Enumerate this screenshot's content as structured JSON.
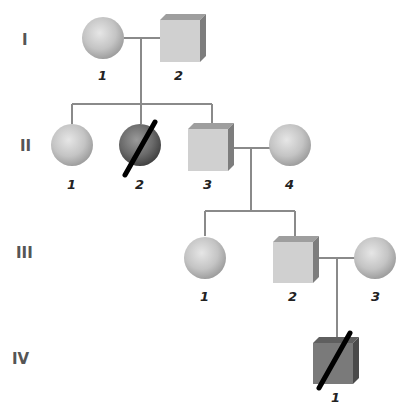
{
  "diagram": {
    "type": "pedigree",
    "colors": {
      "line": "#8a8a8a",
      "unaffected_fill": "#cfcfcf",
      "affected_fill": "#6e6e6e",
      "deceased_slash": "#000000"
    },
    "generations": [
      {
        "label": "I",
        "individuals": [
          {
            "id": "I-1",
            "number": "1",
            "sex": "female",
            "affected": false,
            "deceased": false
          },
          {
            "id": "I-2",
            "number": "2",
            "sex": "male",
            "affected": false,
            "deceased": false
          }
        ]
      },
      {
        "label": "II",
        "individuals": [
          {
            "id": "II-1",
            "number": "1",
            "sex": "female",
            "affected": false,
            "deceased": false
          },
          {
            "id": "II-2",
            "number": "2",
            "sex": "female",
            "affected": true,
            "deceased": true
          },
          {
            "id": "II-3",
            "number": "3",
            "sex": "male",
            "affected": false,
            "deceased": false
          },
          {
            "id": "II-4",
            "number": "4",
            "sex": "female",
            "affected": false,
            "deceased": false
          }
        ]
      },
      {
        "label": "III",
        "individuals": [
          {
            "id": "III-1",
            "number": "1",
            "sex": "female",
            "affected": false,
            "deceased": false
          },
          {
            "id": "III-2",
            "number": "2",
            "sex": "male",
            "affected": false,
            "deceased": false
          },
          {
            "id": "III-3",
            "number": "3",
            "sex": "female",
            "affected": false,
            "deceased": false
          }
        ]
      },
      {
        "label": "IV",
        "individuals": [
          {
            "id": "IV-1",
            "number": "1",
            "sex": "male",
            "affected": true,
            "deceased": true
          }
        ]
      }
    ],
    "matings": [
      {
        "partners": [
          "I-1",
          "I-2"
        ],
        "children": [
          "II-1",
          "II-2",
          "II-3"
        ]
      },
      {
        "partners": [
          "II-3",
          "II-4"
        ],
        "children": [
          "III-1",
          "III-2"
        ]
      },
      {
        "partners": [
          "III-2",
          "III-3"
        ],
        "children": [
          "IV-1"
        ]
      }
    ]
  }
}
